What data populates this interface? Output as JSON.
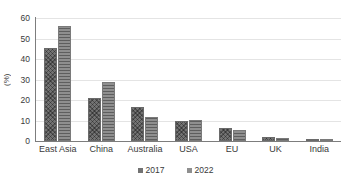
{
  "chart_data": {
    "type": "bar",
    "title": "",
    "xlabel": "",
    "ylabel": "(%)",
    "ylim": [
      0,
      60
    ],
    "yticks": [
      0,
      10,
      20,
      30,
      40,
      50,
      60
    ],
    "grid": true,
    "legend_position": "bottom",
    "categories": [
      "East Asia",
      "China",
      "Australia",
      "USA",
      "EU",
      "UK",
      "India"
    ],
    "series": [
      {
        "name": "2017",
        "color": "#737373",
        "values": [
          45.5,
          21.0,
          16.5,
          10.0,
          6.5,
          2.0,
          0.8
        ]
      },
      {
        "name": "2022",
        "color": "#8f8f8f",
        "values": [
          56.0,
          29.0,
          11.5,
          10.2,
          5.5,
          1.3,
          0.3
        ]
      }
    ]
  },
  "axis": {
    "y_title": "(%)",
    "tick_labels": [
      "60",
      "50",
      "40",
      "30",
      "20",
      "10",
      "0"
    ]
  },
  "legend": {
    "items": [
      {
        "label": "2017",
        "color": "#737373"
      },
      {
        "label": "2022",
        "color": "#8f8f8f"
      }
    ]
  }
}
